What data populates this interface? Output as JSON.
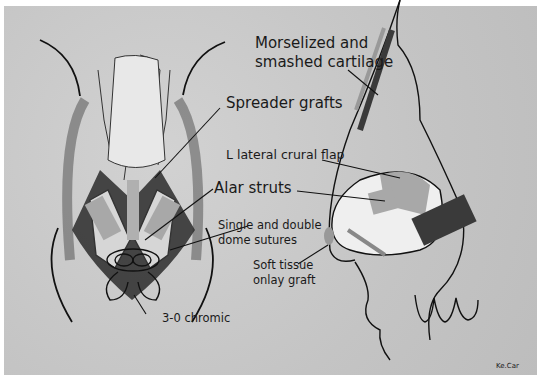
{
  "figure": {
    "type": "medical-illustration",
    "colors": {
      "background": "#c9c9c9",
      "graft_light": "#a8a8a8",
      "graft_dark": "#4a4a4a",
      "line": "#111111",
      "skin": "#f2f2f2"
    }
  },
  "labels": {
    "morselized": "Morselized and",
    "morselized_2": "smashed cartilage",
    "spreader": "Spreader grafts",
    "lateral_crural": "L lateral crural flap",
    "alar_struts": "Alar struts",
    "dome_sutures": "Single and double",
    "dome_sutures_2": "dome sutures",
    "soft_tissue": "Soft tissue",
    "soft_tissue_2": "onlay graft",
    "chromic": "3-0 chromic",
    "credit": "Ke.Car"
  }
}
